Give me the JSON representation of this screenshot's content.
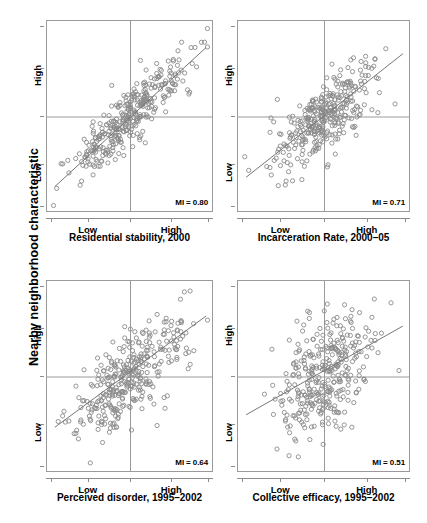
{
  "figure": {
    "y_axis_label": "Nearby neighborhood characteristic",
    "background": "#ffffff",
    "point_color": "#8a8a8a",
    "line_color": "#777777",
    "axis_color": "#9a9a9a"
  },
  "chart_data": {
    "type": "scatter",
    "title": "",
    "xlabel": "",
    "ylabel": "Nearby neighborhood characteristic",
    "grid": false,
    "legend": "none",
    "shared_tick_labels": {
      "x": [
        "Low",
        "High"
      ],
      "y": [
        "Low",
        "High"
      ]
    },
    "panels": [
      {
        "id": "panel-residential-stability",
        "caption": "Residential stability, 2000",
        "xlabel": "Residential stability, 2000",
        "ylabel": "Nearby neighborhood characteristic",
        "annotation": "MI = 0.80",
        "moran_i": 0.8,
        "n_points": 343,
        "xlim": [
          -3.2,
          3.2
        ],
        "ylim": [
          -3.2,
          3.2
        ],
        "xticks": [
          -3.0,
          -1.6,
          0.0,
          1.6,
          3.0
        ],
        "xtick_labels": [
          "",
          "Low",
          "",
          "High",
          ""
        ],
        "yticks": [
          -3.0,
          -1.6,
          0.0,
          1.6,
          3.0
        ],
        "ytick_labels": [
          "",
          "Low",
          "",
          "High",
          ""
        ],
        "crosshair": {
          "x": 0.0,
          "y": 0.0
        },
        "fit_line": {
          "slope": 0.8,
          "intercept": 0.0,
          "x_from": -2.9,
          "x_to": 2.9
        },
        "seed": 11,
        "spread": 0.62,
        "tail_stretch": 1.08
      },
      {
        "id": "panel-incarceration-rate",
        "caption": "Incarceration Rate, 2000–05",
        "xlabel": "Incarceration Rate, 2000–05",
        "ylabel": "Nearby neighborhood characteristic",
        "annotation": "MI = 0.71",
        "moran_i": 0.71,
        "n_points": 343,
        "xlim": [
          -3.2,
          3.2
        ],
        "ylim": [
          -3.2,
          3.2
        ],
        "xticks": [
          -3.0,
          -1.6,
          0.0,
          1.6,
          3.0
        ],
        "xtick_labels": [
          "",
          "Low",
          "",
          "High",
          ""
        ],
        "yticks": [
          -3.0,
          -1.6,
          0.0,
          1.6,
          3.0
        ],
        "ytick_labels": [
          "",
          "Low",
          "",
          "High",
          ""
        ],
        "crosshair": {
          "x": 0.0,
          "y": 0.0
        },
        "fit_line": {
          "slope": 0.71,
          "intercept": 0.05,
          "x_from": -2.9,
          "x_to": 2.9
        },
        "seed": 27,
        "spread": 0.7,
        "tail_stretch": 0.95
      },
      {
        "id": "panel-perceived-disorder",
        "caption": "Perceived disorder, 1995–2002",
        "xlabel": "Perceived disorder, 1995–2002",
        "ylabel": "Nearby neighborhood characteristic",
        "annotation": "MI = 0.64",
        "moran_i": 0.64,
        "n_points": 343,
        "xlim": [
          -3.2,
          3.2
        ],
        "ylim": [
          -3.2,
          3.2
        ],
        "xticks": [
          -3.0,
          -1.6,
          0.0,
          1.6,
          3.0
        ],
        "xtick_labels": [
          "",
          "Low",
          "",
          "High",
          ""
        ],
        "yticks": [
          -3.0,
          -1.6,
          0.0,
          1.6,
          3.0
        ],
        "ytick_labels": [
          "",
          "Low",
          "",
          "High",
          ""
        ],
        "crosshair": {
          "x": 0.0,
          "y": 0.0
        },
        "fit_line": {
          "slope": 0.64,
          "intercept": 0.18,
          "x_from": -2.9,
          "x_to": 2.9
        },
        "seed": 43,
        "spread": 0.8,
        "tail_stretch": 1.0
      },
      {
        "id": "panel-collective-efficacy",
        "caption": "Collective efficacy, 1995–2002",
        "xlabel": "Collective efficacy, 1995–2002",
        "ylabel": "Nearby neighborhood characteristic",
        "annotation": "MI = 0.51",
        "moran_i": 0.51,
        "n_points": 343,
        "xlim": [
          -3.2,
          3.2
        ],
        "ylim": [
          -3.2,
          3.2
        ],
        "xticks": [
          -3.0,
          -1.6,
          0.0,
          1.6,
          3.0
        ],
        "xtick_labels": [
          "",
          "Low",
          "",
          "High",
          ""
        ],
        "yticks": [
          -3.0,
          -1.6,
          0.0,
          1.6,
          3.0
        ],
        "ytick_labels": [
          "",
          "Low",
          "",
          "High",
          ""
        ],
        "crosshair": {
          "x": 0.0,
          "y": 0.0
        },
        "fit_line": {
          "slope": 0.51,
          "intercept": 0.22,
          "x_from": -2.9,
          "x_to": 2.9
        },
        "seed": 67,
        "spread": 0.92,
        "tail_stretch": 0.88
      }
    ]
  },
  "layout": {
    "panel_boxes": [
      {
        "left": 46,
        "top": 20,
        "width": 167,
        "height": 192
      },
      {
        "left": 237,
        "top": 20,
        "width": 173,
        "height": 192
      },
      {
        "left": 46,
        "top": 280,
        "width": 167,
        "height": 192
      },
      {
        "left": 237,
        "top": 280,
        "width": 173,
        "height": 192
      }
    ],
    "caption_tops": [
      232,
      232,
      492,
      492
    ]
  }
}
